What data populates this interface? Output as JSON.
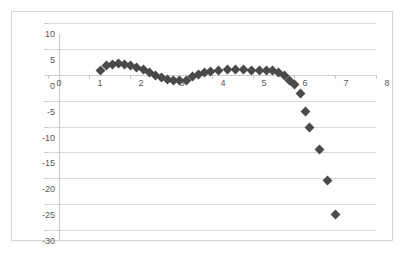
{
  "chart_data": {
    "type": "scatter",
    "title": "",
    "subtitle": "",
    "xlabel": "",
    "ylabel": "",
    "xlim": [
      0,
      8
    ],
    "ylim": [
      -30,
      10
    ],
    "x_ticks": [
      0,
      1,
      2,
      3,
      4,
      5,
      6,
      7,
      8
    ],
    "x_tick_labels": [
      "0",
      "1",
      "2",
      "3",
      "4",
      "5",
      "6",
      "7",
      "8"
    ],
    "y_ticks": [
      10,
      5,
      0,
      -5,
      -10,
      -15,
      -20,
      -25,
      -30
    ],
    "y_tick_labels": [
      "10",
      "5",
      "0",
      "-5",
      "-10",
      "-15",
      "-20",
      "-25",
      "-30"
    ],
    "grid": "horizontal",
    "legend": "none",
    "marker": "diamond",
    "marker_color": "#4a4a4a",
    "series": [
      {
        "name": "Series1",
        "points": [
          [
            1.0,
            2.9
          ],
          [
            1.15,
            3.9
          ],
          [
            1.3,
            4.2
          ],
          [
            1.45,
            4.3
          ],
          [
            1.6,
            4.2
          ],
          [
            1.75,
            3.9
          ],
          [
            1.9,
            3.5
          ],
          [
            2.05,
            3.1
          ],
          [
            2.2,
            2.5
          ],
          [
            2.35,
            2.0
          ],
          [
            2.5,
            1.5
          ],
          [
            2.65,
            1.2
          ],
          [
            2.8,
            1.0
          ],
          [
            2.95,
            1.0
          ],
          [
            3.1,
            1.1
          ],
          [
            3.25,
            1.7
          ],
          [
            3.4,
            2.2
          ],
          [
            3.55,
            2.6
          ],
          [
            3.7,
            2.8
          ],
          [
            3.9,
            3.0
          ],
          [
            4.1,
            3.1
          ],
          [
            4.3,
            3.1
          ],
          [
            4.5,
            3.1
          ],
          [
            4.7,
            3.0
          ],
          [
            4.9,
            3.0
          ],
          [
            5.05,
            2.9
          ],
          [
            5.2,
            2.9
          ],
          [
            5.35,
            2.5
          ],
          [
            5.5,
            1.9
          ],
          [
            5.62,
            1.0
          ],
          [
            5.75,
            0.2
          ],
          [
            5.88,
            -1.5
          ],
          [
            6.0,
            -4.9
          ],
          [
            6.1,
            -8.0
          ],
          [
            6.35,
            -12.3
          ],
          [
            6.55,
            -18.4
          ],
          [
            6.75,
            -24.9
          ]
        ]
      }
    ]
  },
  "colors": {
    "marker": "#4a4a4a",
    "gridline": "#d9d9d9",
    "axis": "#c9c9c9",
    "frame": "#d4d4d4",
    "tick_text": "#595959",
    "background": "#ffffff"
  }
}
